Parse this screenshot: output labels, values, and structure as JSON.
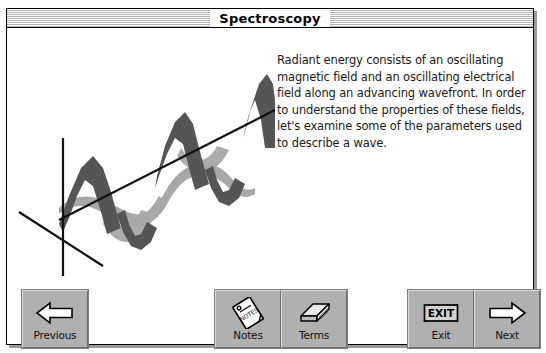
{
  "window": {
    "title": "Spectroscopy"
  },
  "content": {
    "body_text": "Radiant energy consists of an oscillating magnetic field and an oscillating electrical field along an advancing wavefront.  In order to understand the properties of these fields, let's examine some of the parameters used to describe a wave.",
    "illustration": {
      "name": "electromagnetic-wave-diagram",
      "description": "Three-dimensional diagram of an electromagnetic wave showing a dark gray oscillating magnetic field wave in the vertical plane and a light gray oscillating electrical field wave in the horizontal plane, both propagating along a diagonal axis from a three-axis origin at lower left.",
      "magnetic_wave_color": "#555555",
      "electric_wave_color": "#a8a8a8",
      "axis_color": "#111111"
    }
  },
  "buttonbar": {
    "groups": [
      {
        "name": "navigation-back",
        "buttons": [
          {
            "label": "Previous",
            "icon": "left-arrow-icon",
            "name": "previous-button"
          }
        ]
      },
      {
        "name": "tools",
        "buttons": [
          {
            "label": "Notes",
            "icon": "notepad-icon",
            "name": "notes-button"
          },
          {
            "label": "Terms",
            "icon": "book-icon",
            "name": "terms-button"
          }
        ]
      },
      {
        "name": "exit-and-forward",
        "buttons": [
          {
            "label": "Exit",
            "icon": "exit-sign-icon",
            "name": "exit-button"
          },
          {
            "label": "Next",
            "icon": "right-arrow-icon",
            "name": "next-button"
          }
        ]
      }
    ]
  },
  "colors": {
    "button_face": "#b0b0b0",
    "button_highlight": "#d8d8d8",
    "button_shadow": "#6e6e6e",
    "window_border": "#000000",
    "title_stripe": "#b4b4b4",
    "divider": "#8c8c8c",
    "page_background": "#ffffff"
  },
  "icon_glyphs": {
    "notepad_label": "NOTES"
  }
}
